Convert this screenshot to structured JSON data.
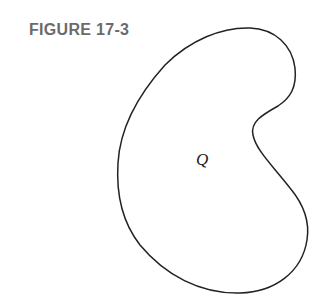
{
  "figure": {
    "title": "FIGURE 17-3",
    "region_label": "Q",
    "shape": "kidney-shaped closed curve",
    "colors": {
      "title": "#6b6b6b",
      "outline": "#222222",
      "background": "#ffffff"
    }
  }
}
